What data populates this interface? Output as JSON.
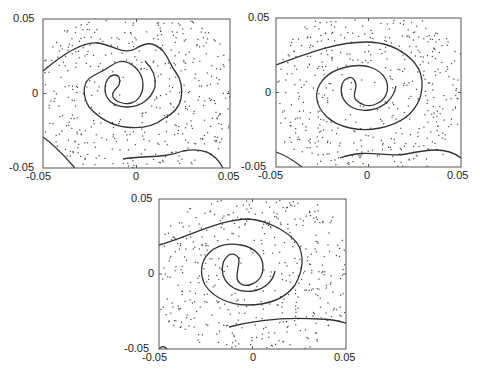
{
  "chart_data": [
    {
      "type": "scatter",
      "title": "",
      "xlabel": "",
      "ylabel": "",
      "xlim": [
        -0.05,
        0.05
      ],
      "ylim": [
        -0.05,
        0.05
      ],
      "xticks": [
        "-0.05",
        "0",
        "0.05"
      ],
      "yticks": [
        "0.05",
        "0",
        "-0.05"
      ],
      "grid": false,
      "series": [
        {
          "name": "samples",
          "kind": "points",
          "count_approx": 500,
          "distribution": "annulus around origin, radius ~0.01–0.05"
        },
        {
          "name": "contour",
          "kind": "line",
          "description": "spiral decision boundary, irregular/wavy (panel 1)"
        }
      ],
      "frame": {
        "x": 43,
        "y": 19,
        "w": 187,
        "h": 149
      },
      "seed": 11,
      "curves": [
        "M0,52 C20,35 40,22 55,24 C70,26 80,36 92,30 C102,24 108,22 118,30 C125,36 128,48 132,52 C138,60 140,70 138,80 C136,90 128,96 120,100 C110,108 98,110 82,108 C66,106 55,98 46,88 C40,78 40,68 44,62 C48,56 58,54 66,48 C72,44 78,40 86,44 C94,48 100,56 100,66 C100,74 96,82 88,84 C80,86 72,82 70,78 C68,72 74,70 76,66 C78,60 76,56 72,56 C66,56 62,62 62,70 C62,80 70,88 84,88 C98,88 108,80 112,68 C114,56 108,48 102,42",
        "M0,118 C14,128 24,140 32,149",
        "M80,140 C100,136 120,140 140,132 C160,128 172,134 180,149"
      ]
    },
    {
      "type": "scatter",
      "title": "",
      "xlabel": "",
      "ylabel": "",
      "xlim": [
        -0.05,
        0.05
      ],
      "ylim": [
        -0.05,
        0.05
      ],
      "xticks": [
        "-0.05",
        "0",
        "0.05"
      ],
      "yticks": [
        "0.05",
        "0",
        "-0.05"
      ],
      "grid": false,
      "series": [
        {
          "name": "samples",
          "kind": "points",
          "count_approx": 500,
          "distribution": "annulus around origin, radius ~0.01–0.05"
        },
        {
          "name": "contour",
          "kind": "line",
          "description": "spiral decision boundary, smoother (panel 2)"
        }
      ],
      "frame": {
        "x": 276,
        "y": 18,
        "w": 185,
        "h": 149
      },
      "seed": 23,
      "curves": [
        "M0,47 C30,36 60,24 90,24 C110,24 126,32 136,42 C146,52 148,66 144,80 C138,96 124,106 104,110 C84,114 62,110 50,98 C40,88 38,76 44,66 C50,56 62,50 76,48 C90,46 104,50 110,62 C114,72 110,82 100,86 C92,90 84,86 80,82 C76,78 80,72 80,68 C80,62 76,58 72,60 C66,62 64,70 66,78 C70,88 80,94 94,92 C108,90 118,80 120,68",
        "M0,134 C12,138 22,146 26,149",
        "M64,140 C90,130 110,140 130,136 C150,132 170,128 185,140"
      ]
    },
    {
      "type": "scatter",
      "title": "",
      "xlabel": "",
      "ylabel": "",
      "xlim": [
        -0.05,
        0.05
      ],
      "ylim": [
        -0.05,
        0.05
      ],
      "xticks": [
        "-0.05",
        "0",
        "0.05"
      ],
      "yticks": [
        "0.05",
        "0",
        "-0.05"
      ],
      "grid": false,
      "series": [
        {
          "name": "samples",
          "kind": "points",
          "count_approx": 500,
          "distribution": "annulus around origin, radius ~0.01–0.05"
        },
        {
          "name": "contour",
          "kind": "line",
          "description": "spiral decision boundary, smooth (panel 3)"
        }
      ],
      "frame": {
        "x": 159,
        "y": 199,
        "w": 187,
        "h": 150
      },
      "seed": 37,
      "curves": [
        "M0,46 C30,38 60,20 90,20 C110,22 128,32 138,44 C146,56 144,72 136,86 C126,100 108,106 88,106 C70,106 54,98 46,86 C40,74 42,62 50,54 C58,46 70,44 82,46 C94,48 104,56 104,68 C104,78 98,84 90,86 C82,88 78,82 78,78 C78,72 80,66 80,62 C80,56 74,54 70,56 C64,60 62,68 64,76 C68,88 80,94 94,92 C106,90 114,82 116,72",
        "M0,150 C4,146 6,148 8,150",
        "M70,128 C100,120 130,118 160,120 C172,120 180,122 187,124"
      ]
    }
  ],
  "panels": [
    {
      "ytick_top": "0.05",
      "ytick_mid": "0",
      "ytick_bot": "-0.05",
      "xtick_left": "-0.05",
      "xtick_mid": "0",
      "xtick_right": "0.05"
    },
    {
      "ytick_top": "0.05",
      "ytick_mid": "0",
      "ytick_bot": "-0.05",
      "xtick_left": "-0.05",
      "xtick_mid": "0",
      "xtick_right": "0.05"
    },
    {
      "ytick_top": "0.05",
      "ytick_mid": "0",
      "ytick_bot": "-0.05",
      "xtick_left": "-0.05",
      "xtick_mid": "0",
      "xtick_right": "0.05"
    }
  ],
  "style": {
    "line_color": "#333333",
    "dot_color": "#444444",
    "frame_color": "#555555"
  }
}
